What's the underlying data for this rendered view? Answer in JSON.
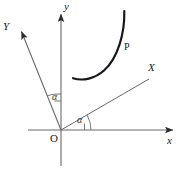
{
  "figure": {
    "name": "rotated-coordinate-axes-with-arc",
    "width": 185,
    "height": 169,
    "background_color": "#ffffff",
    "line_color": "#555555",
    "arc_color": "#1a1a1a",
    "text_color": "#1a1a1a"
  },
  "labels": {
    "y_axis_lower": "y",
    "x_axis_lower": "x",
    "Y_axis_upper": "Y",
    "X_axis_upper": "X",
    "origin": "O",
    "point_P": "P",
    "angle_1": "α",
    "angle_2": "α"
  },
  "geometry": {
    "origin": {
      "x": 61,
      "y": 130
    },
    "axes": [
      {
        "name": "y-axis-lower",
        "type": "arrow",
        "from": {
          "x": 61,
          "y": 165
        },
        "to": {
          "x": 61,
          "y": 12
        },
        "label": "y",
        "label_pos": {
          "x": 64,
          "y": 2
        },
        "italic": true
      },
      {
        "name": "x-axis-lower",
        "type": "arrow",
        "from": {
          "x": 28,
          "y": 130
        },
        "to": {
          "x": 176,
          "y": 130
        },
        "label": "x",
        "label_pos": {
          "x": 168,
          "y": 136
        },
        "italic": true
      },
      {
        "name": "Y-axis-upper",
        "type": "arrow",
        "from": {
          "x": 61,
          "y": 130
        },
        "to": {
          "x": 20,
          "y": 29
        },
        "label": "Y",
        "label_pos": {
          "x": 4,
          "y": 22
        },
        "italic": true
      },
      {
        "name": "X-axis-upper",
        "type": "arrow",
        "from": {
          "x": 61,
          "y": 130
        },
        "to": {
          "x": 149,
          "y": 79
        },
        "label": "X",
        "label_pos": {
          "x": 149,
          "y": 63
        },
        "italic": true
      }
    ],
    "angles": [
      {
        "name": "angle-between-Y-and-y",
        "label": "α",
        "label_pos": {
          "x": 53,
          "y": 96
        },
        "arc_center": {
          "x": 61,
          "y": 130
        },
        "arc_radius": 37,
        "from_deg": 112,
        "to_deg": 90
      },
      {
        "name": "angle-between-x-and-X",
        "label": "α",
        "label_pos": {
          "x": 78,
          "y": 119
        },
        "arc_center": {
          "x": 61,
          "y": 130
        },
        "arc_radius": 28,
        "from_deg": 0,
        "to_deg": 30
      }
    ],
    "curve_P": {
      "name": "thick-arc-P",
      "description": "thick concave-left arc in the first quadrant",
      "start": {
        "x": 124,
        "y": 11
      },
      "end": {
        "x": 73,
        "y": 79
      },
      "stroke_width": 2.2,
      "label": "P",
      "label_pos": {
        "x": 125,
        "y": 43
      }
    },
    "tick_marks": [
      {
        "name": "angle-1-tick",
        "from": {
          "x": 61,
          "y": 100
        },
        "to": {
          "x": 55,
          "y": 100
        }
      },
      {
        "name": "angle-2-tick",
        "from": {
          "x": 84,
          "y": 130
        },
        "to": {
          "x": 84,
          "y": 123
        }
      }
    ]
  }
}
